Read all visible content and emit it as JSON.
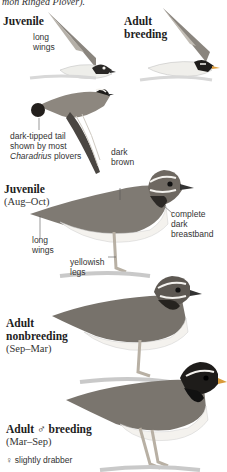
{
  "page": {
    "top_caption": "mon Ringed Plover).",
    "sections": [
      {
        "title": "Juvenile",
        "subtitle": "",
        "annotations": [
          "long",
          "wings"
        ]
      },
      {
        "title_line1": "Adult",
        "title_line2": "breeding"
      },
      {
        "annotation_tail_line1": "dark-tipped tail",
        "annotation_tail_line2": "shown by most",
        "annotation_tail_line3_italic": "Charadrius",
        "annotation_tail_line3_rest": " plovers"
      },
      {
        "title": "Juvenile",
        "subtitle": "(Aug–Oct)",
        "annotations": {
          "back_line1": "dark",
          "back_line2": "brown",
          "breast_line1": "complete",
          "breast_line2": "dark",
          "breast_line3": "breastband",
          "wings_line1": "long",
          "wings_line2": "wings",
          "legs_line1": "yellowish",
          "legs_line2": "legs"
        }
      },
      {
        "title_line1": "Adult",
        "title_line2": "nonbreeding",
        "subtitle": "(Sep–Mar)"
      },
      {
        "title": "Adult ♂ breeding",
        "subtitle": "(Mar–Sep)",
        "female_note": "♀ slightly drabber"
      }
    ]
  },
  "colors": {
    "background": "#ffffff",
    "text": "#222222",
    "leader_line": "#555555",
    "bird_back": "#7f7a73",
    "bird_dark": "#1e1c1a",
    "bird_belly": "#f4f2ee",
    "legs": "#b8b0a4",
    "ground": "#c9c9c9"
  }
}
